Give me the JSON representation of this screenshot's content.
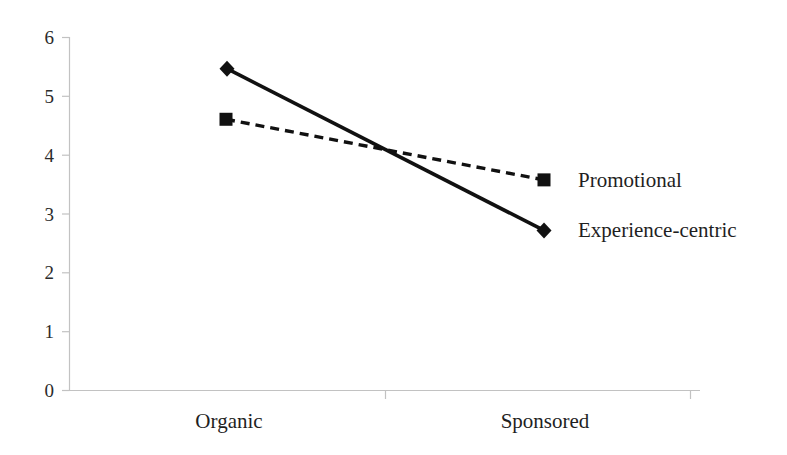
{
  "chart_data": {
    "type": "line",
    "title": "",
    "subtitle": "",
    "xlabel": "",
    "ylabel": "",
    "categories": [
      "Organic",
      "Sponsored"
    ],
    "series": [
      {
        "name": "Experience-centric",
        "values": [
          5.47,
          2.72
        ],
        "line_style": "solid",
        "marker": "diamond",
        "color": "#111111"
      },
      {
        "name": "Promotional",
        "values": [
          4.61,
          3.58
        ],
        "line_style": "dashed",
        "marker": "square",
        "color": "#111111"
      }
    ],
    "ylim": [
      0,
      6
    ],
    "ytick_labels": [
      "0",
      "1",
      "2",
      "3",
      "4",
      "5",
      "6"
    ],
    "ytick_values": [
      0,
      1,
      2,
      3,
      4,
      5,
      6
    ],
    "grid": false,
    "legend": "inline-right-of-endpoints",
    "legend_entries": [
      "Promotional",
      "Experience-centric"
    ],
    "axis_color": "#bdbdbd"
  },
  "axis": {
    "y_ticks": [
      {
        "label": "6",
        "value": 6
      },
      {
        "label": "5",
        "value": 5
      },
      {
        "label": "4",
        "value": 4
      },
      {
        "label": "3",
        "value": 3
      },
      {
        "label": "2",
        "value": 2
      },
      {
        "label": "1",
        "value": 1
      },
      {
        "label": "0",
        "value": 0
      }
    ],
    "x_categories": [
      {
        "label": "Organic"
      },
      {
        "label": "Sponsored"
      }
    ]
  },
  "legend": {
    "promotional": "Promotional",
    "experience_centric": "Experience-centric"
  }
}
